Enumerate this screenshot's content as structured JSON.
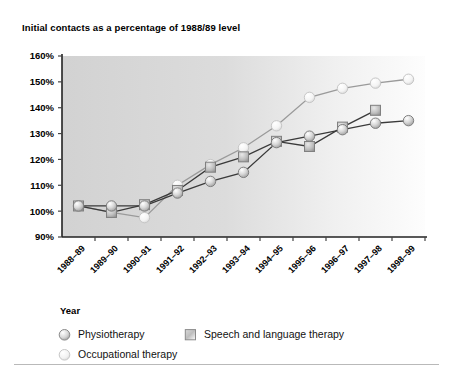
{
  "figure": {
    "title": "Initial contacts as a percentage of 1988/89 level",
    "x_axis_title": "Year",
    "background": "#ffffff"
  },
  "legend": {
    "entries": [
      {
        "label": "Physiotherapy",
        "marker": "circle",
        "color": "#6f6f6f",
        "name": "legend-physiotherapy"
      },
      {
        "label": "Speech and language therapy",
        "marker": "square",
        "color": "#6f6f6f",
        "name": "legend-speech-and-language-therapy"
      },
      {
        "label": "Occupational therapy",
        "marker": "circle",
        "color": "#c9c9c9",
        "name": "legend-occupational-therapy"
      }
    ]
  },
  "chart_data": {
    "type": "line",
    "title": "Initial contacts as a percentage of 1988/89 level",
    "xlabel": "Year",
    "ylabel": "",
    "grid": false,
    "legend_position": "bottom-left",
    "ylim": [
      90,
      160
    ],
    "ytick_labels": [
      "160%",
      "150%",
      "140%",
      "130%",
      "120%",
      "110%",
      "100%",
      "90%"
    ],
    "ytick_values": [
      160,
      150,
      140,
      130,
      120,
      110,
      100,
      90
    ],
    "categories": [
      "1988–89",
      "1989–90",
      "1990–91",
      "1991–92",
      "1992–93",
      "1993–94",
      "1994–95",
      "1995–96",
      "1996–97",
      "1997–98",
      "1998–99"
    ],
    "series": [
      {
        "name": "Physiotherapy",
        "marker": "circle",
        "color": "#8a8a8a",
        "line_color": "#3a3a3a",
        "values": [
          102,
          102,
          102,
          107,
          111.5,
          115,
          126.5,
          129,
          131.5,
          134,
          135
        ]
      },
      {
        "name": "Speech and language therapy",
        "marker": "square",
        "color": "#9a9a9a",
        "line_color": "#3a3a3a",
        "values": [
          102,
          99.5,
          102.5,
          108,
          117,
          121,
          127,
          125,
          132.5,
          139,
          null
        ]
      },
      {
        "name": "Occupational therapy",
        "marker": "circle",
        "color": "#d4d4d4",
        "line_color": "#9a9a9a",
        "values": [
          102,
          99.5,
          97.5,
          110,
          118,
          124.5,
          133,
          144,
          147.5,
          149.5,
          151
        ]
      }
    ]
  }
}
